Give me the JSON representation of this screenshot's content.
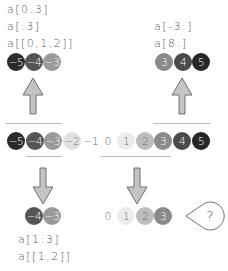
{
  "labels": {
    "top_left": [
      "a[0:3]",
      "a[:3]",
      "a[[0,1,2]]"
    ],
    "top_right": [
      "a[-3:]",
      "a[8:]"
    ],
    "bottom_left": [
      "a[1:3]",
      "a[[1,2]]"
    ],
    "question_mark": "?"
  },
  "colors": {
    "-5": "#2b2b2b",
    "-4": "#555555",
    "-3": "#9a9a9a",
    "-2": "#e0e0e0",
    "1": "#ececec",
    "2": "#bdbdbd",
    "3": "#8a8a8a",
    "4": "#4a4a4a",
    "5": "#262626",
    "arrow_fill": "#c4c4c4",
    "arrow_stroke": "#6f6f6f",
    "line": "#bdbdbd"
  },
  "rows": {
    "top_left": [
      {
        "text": "−5",
        "x": 16,
        "color": "#2b2b2b",
        "fg": "#ffffff"
      },
      {
        "text": "−4",
        "x": 34,
        "color": "#555555",
        "fg": "#ffffff"
      },
      {
        "text": "−3",
        "x": 52,
        "color": "#9a9a9a",
        "fg": "#ffffff"
      }
    ],
    "top_right": [
      {
        "text": "3",
        "x": 164,
        "color": "#8a8a8a",
        "fg": "#ffffff"
      },
      {
        "text": "4",
        "x": 183,
        "color": "#4a4a4a",
        "fg": "#ffffff"
      },
      {
        "text": "5",
        "x": 201,
        "color": "#262626",
        "fg": "#ffffff"
      }
    ],
    "middle": [
      {
        "text": "−5",
        "x": 16,
        "color": "#2b2b2b",
        "fg": "#ffffff"
      },
      {
        "text": "−4",
        "x": 35,
        "color": "#555555",
        "fg": "#ffffff"
      },
      {
        "text": "−3",
        "x": 53,
        "color": "#9a9a9a",
        "fg": "#ffffff"
      },
      {
        "text": "−2",
        "x": 72,
        "color": "#e0e0e0",
        "fg": "#777777"
      },
      {
        "text": "−1",
        "x": 91,
        "color": "",
        "fg": "#666666"
      },
      {
        "text": "0",
        "x": 108,
        "color": "",
        "fg": "#666666"
      },
      {
        "text": "1",
        "x": 126,
        "color": "#ececec",
        "fg": "#777777"
      },
      {
        "text": "2",
        "x": 145,
        "color": "#bdbdbd",
        "fg": "#666666"
      },
      {
        "text": "3",
        "x": 163,
        "color": "#8a8a8a",
        "fg": "#ffffff"
      },
      {
        "text": "4",
        "x": 182,
        "color": "#4a4a4a",
        "fg": "#ffffff"
      },
      {
        "text": "5",
        "x": 201,
        "color": "#262626",
        "fg": "#ffffff"
      }
    ],
    "bottom_left": [
      {
        "text": "−4",
        "x": 34,
        "color": "#555555",
        "fg": "#ffffff"
      },
      {
        "text": "−3",
        "x": 52,
        "color": "#9a9a9a",
        "fg": "#ffffff"
      }
    ],
    "bottom_right": [
      {
        "text": "0",
        "x": 108,
        "color": "",
        "fg": "#666666"
      },
      {
        "text": "1",
        "x": 126,
        "color": "#ececec",
        "fg": "#777777"
      },
      {
        "text": "2",
        "x": 145,
        "color": "#bdbdbd",
        "fg": "#666666"
      },
      {
        "text": "3",
        "x": 163,
        "color": "#8a8a8a",
        "fg": "#ffffff"
      }
    ]
  }
}
